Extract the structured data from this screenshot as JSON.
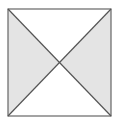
{
  "diagram": {
    "type": "square-with-diagonals",
    "square": {
      "x1": 8,
      "y1": 9,
      "x2": 111,
      "y2": 116
    },
    "center": {
      "x": 59.5,
      "y": 62.5
    },
    "colors": {
      "background": "#ffffff",
      "shaded_fill": "#e4e4e4",
      "unshaded_fill": "#ffffff",
      "stroke": "#666666"
    },
    "regions": [
      {
        "name": "left-triangle",
        "shaded": true
      },
      {
        "name": "right-triangle",
        "shaded": true
      },
      {
        "name": "top-triangle",
        "shaded": false
      },
      {
        "name": "bottom-triangle",
        "shaded": false
      }
    ]
  }
}
